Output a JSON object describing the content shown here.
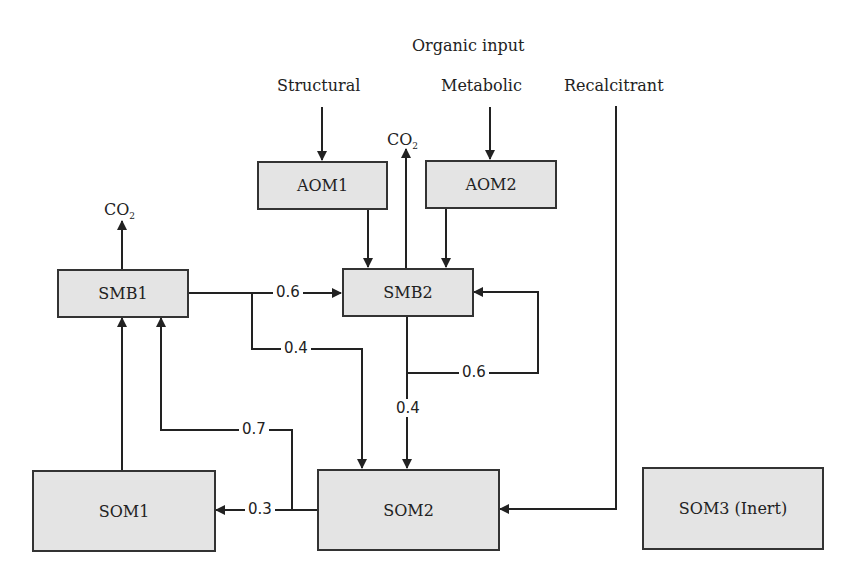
{
  "diagram": {
    "title_label": "Organic input",
    "inputs": {
      "structural": "Structural",
      "metabolic": "Metabolic",
      "recalcitrant": "Recalcitrant"
    },
    "co2": {
      "main": "CO",
      "sub": "2"
    },
    "boxes": {
      "aom1": "AOM1",
      "aom2": "AOM2",
      "smb1": "SMB1",
      "smb2": "SMB2",
      "som1": "SOM1",
      "som2": "SOM2",
      "som3": "SOM3 (Inert)"
    },
    "fractions": {
      "smb1_to_smb2": "0.6",
      "smb1_to_som2": "0.4",
      "smb2_to_smb2": "0.6",
      "smb2_to_som2": "0.4",
      "som2_to_smb1": "0.7",
      "som2_to_som1": "0.3"
    },
    "colors": {
      "box_fill": "#e4e4e4",
      "line": "#222222"
    }
  }
}
